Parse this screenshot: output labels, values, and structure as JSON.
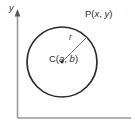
{
  "figure": {
    "type": "geometry-diagram",
    "background_color": "#ffffff",
    "width": 135,
    "height": 136
  },
  "axes": {
    "y_axis": {
      "label": "y",
      "icon": "axis-arrow-up-icon",
      "color": "#9a9a9a",
      "x": 17.5,
      "y_top": 14,
      "y_bottom": 118
    },
    "x_axis": {
      "label": "",
      "color": "#9a9a9a",
      "y": 118,
      "x_left": 17.5,
      "x_right": 131
    }
  },
  "circle": {
    "center_x": 62,
    "center_y": 62,
    "radius": 35,
    "stroke_color": "#2b2b2b",
    "stroke_width": 1.7,
    "fill": "none"
  },
  "radius_segment": {
    "label": "r",
    "from_x": 62,
    "from_y": 62,
    "to_x": 87,
    "to_y": 37,
    "color": "#6d6d6d"
  },
  "labels": {
    "center": {
      "prefix": "C(",
      "var1": "a",
      "separator": ", ",
      "var2": "b",
      "suffix": ")",
      "full": "C(a, b)"
    },
    "point": {
      "prefix": "P(",
      "var1": "x",
      "separator": ", ",
      "var2": "y",
      "suffix": ")",
      "full": "P(x, y)"
    },
    "radius": "r",
    "axis_y": "y"
  }
}
